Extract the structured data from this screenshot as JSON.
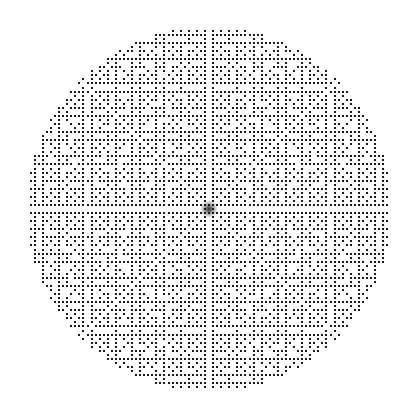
{
  "figure": {
    "title": "",
    "subtitle": "",
    "caption": "",
    "background_color": "#ffffff",
    "width": 414,
    "height": 417
  },
  "chart_data": {
    "type": "scatter",
    "title": "",
    "subtitle": "",
    "xlabel": "",
    "ylabel": "",
    "legend": [],
    "legend_position": "none",
    "grid": false,
    "axes_visible": false,
    "ticks_visible": false,
    "tick_labels": [],
    "annotations": [],
    "xlim": [
      -45,
      45
    ],
    "ylim": [
      -45,
      45
    ],
    "generator": {
      "rule": "coprime-visible-lattice-points",
      "condition": "gcd(abs(i), abs(j)) == 1",
      "include_axis_unit_points": true,
      "lattice_radius_units": 45,
      "symmetry": "8-fold (horizontal, vertical and both diagonal mirrors)"
    },
    "marker": {
      "shape": "square",
      "size_px": 2,
      "color": "#1a1a1a",
      "opacity": 1
    },
    "geometry": {
      "center_x_px": 209,
      "center_y_px": 209,
      "radius_px": 182,
      "grid_pitch_px": 4.05,
      "core_density_boost_radius_px": 9
    },
    "point_count_estimate": 2460,
    "axis_ranges_px": {
      "left_edge": 27,
      "right_edge": 391,
      "top_edge": 27,
      "bottom_edge": 391
    }
  }
}
